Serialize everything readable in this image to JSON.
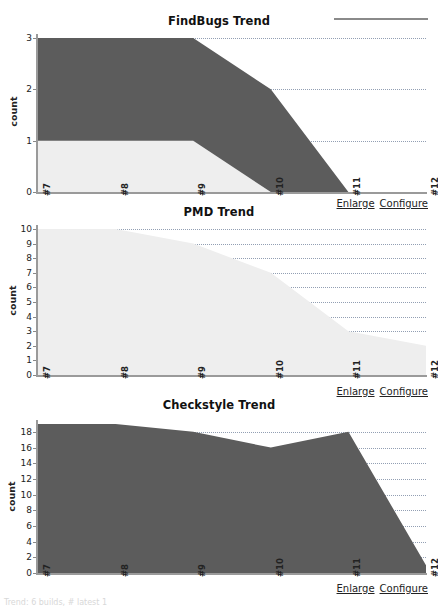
{
  "page": {
    "background": "#ffffff",
    "footer_text": "Trend: 6 builds, # latest 1"
  },
  "colors": {
    "series_dark": "#5c5c5c",
    "series_light": "#eeeeee",
    "axis": "#9a9a9a",
    "grid": "#7f8fa6",
    "text": "#222222"
  },
  "panels": [
    {
      "id": "findbugs",
      "title": "FindBugs Trend",
      "ylabel": "count",
      "links": {
        "enlarge": "Enlarge",
        "configure": "Configure"
      }
    },
    {
      "id": "pmd",
      "title": "PMD Trend",
      "ylabel": "count",
      "links": {
        "enlarge": "Enlarge",
        "configure": "Configure"
      }
    },
    {
      "id": "checkstyle",
      "title": "Checkstyle Trend",
      "ylabel": "count",
      "links": {
        "enlarge": "Enlarge",
        "configure": "Configure"
      }
    }
  ],
  "chart_data": [
    {
      "id": "findbugs",
      "type": "area",
      "stacked": true,
      "title": "FindBugs Trend",
      "xlabel": "",
      "ylabel": "count",
      "categories": [
        "#7",
        "#8",
        "#9",
        "#10",
        "#11",
        "#12"
      ],
      "yticks": [
        0,
        1,
        2,
        3
      ],
      "ylim": [
        0,
        3
      ],
      "grid": true,
      "legend": "none",
      "series": [
        {
          "name": "low",
          "color": "#eeeeee",
          "values": [
            1,
            1,
            1,
            0,
            0,
            0
          ]
        },
        {
          "name": "normal",
          "color": "#5c5c5c",
          "values": [
            2,
            2,
            2,
            2,
            0,
            0
          ]
        }
      ],
      "totals": [
        3,
        3,
        3,
        2,
        0,
        0
      ]
    },
    {
      "id": "pmd",
      "type": "area",
      "stacked": false,
      "title": "PMD Trend",
      "xlabel": "",
      "ylabel": "count",
      "categories": [
        "#7",
        "#8",
        "#9",
        "#10",
        "#11",
        "#12"
      ],
      "yticks": [
        0,
        1,
        2,
        3,
        4,
        5,
        6,
        7,
        8,
        9,
        10
      ],
      "ylim": [
        0,
        10
      ],
      "grid": true,
      "legend": "none",
      "series": [
        {
          "name": "low",
          "color": "#eeeeee",
          "values": [
            10,
            10,
            9,
            7,
            3,
            2
          ]
        }
      ],
      "totals": [
        10,
        10,
        9,
        7,
        3,
        2
      ]
    },
    {
      "id": "checkstyle",
      "type": "area",
      "stacked": false,
      "title": "Checkstyle Trend",
      "xlabel": "",
      "ylabel": "count",
      "categories": [
        "#7",
        "#8",
        "#9",
        "#10",
        "#11",
        "#12"
      ],
      "yticks": [
        0,
        2,
        4,
        6,
        8,
        10,
        12,
        14,
        16,
        18
      ],
      "ylim": [
        0,
        19
      ],
      "grid": true,
      "legend": "none",
      "series": [
        {
          "name": "normal",
          "color": "#5c5c5c",
          "values": [
            19,
            19,
            18,
            16,
            18,
            1
          ]
        }
      ],
      "totals": [
        19,
        19,
        18,
        16,
        18,
        1
      ]
    }
  ]
}
